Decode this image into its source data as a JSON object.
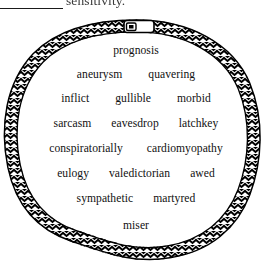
{
  "page": {
    "background_color": "#ffffff",
    "ink_color": "#111111"
  },
  "header": {
    "blank_rule": "",
    "clipped_text": "sensitivity.",
    "note": "top line is cropped by the page edge"
  },
  "rope": {
    "icon": "rope-loop-icon",
    "texture": "chevron-braid",
    "stroke_color": "#000000",
    "fill_color": "#ffffff",
    "clasp": {
      "icon": "clasp-icon",
      "position": "top-center"
    }
  },
  "word_field": {
    "rows": [
      {
        "words": [
          "prognosis"
        ]
      },
      {
        "words": [
          "aneurysm",
          "quavering"
        ]
      },
      {
        "words": [
          "inflict",
          "gullible",
          "morbid"
        ]
      },
      {
        "words": [
          "sarcasm",
          "eavesdrop",
          "latchkey"
        ]
      },
      {
        "words": [
          "conspiratorially",
          "cardiomyopathy"
        ]
      },
      {
        "words": [
          "eulogy",
          "valedictorian",
          "awed"
        ]
      },
      {
        "words": [
          "sympathetic",
          "martyred"
        ]
      },
      {
        "words": [
          "miser"
        ]
      }
    ]
  }
}
